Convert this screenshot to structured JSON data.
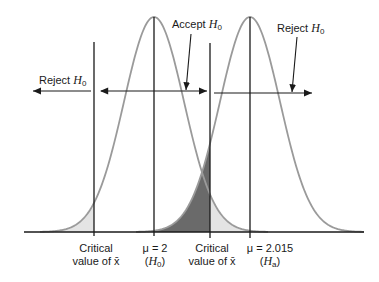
{
  "diagram": {
    "labels": {
      "reject_left": {
        "text": "Reject",
        "symbol": "H",
        "sub": "0"
      },
      "accept": {
        "text": "Accept",
        "symbol": "H",
        "sub": "0"
      },
      "reject_right": {
        "text": "Reject",
        "symbol": "H",
        "sub": "0"
      },
      "critical_left": {
        "line1": "Critical",
        "line2": "value of x̄"
      },
      "mu_null": {
        "line1": "μ = 2",
        "line2_symbol": "H",
        "line2_sub": "0"
      },
      "critical_right": {
        "line1": "Critical",
        "line2": "value of x̄"
      },
      "mu_alt": {
        "line1": "μ = 2.015",
        "line2_symbol": "H",
        "line2_sub": "a"
      }
    },
    "curves": [
      {
        "name": "null-distribution",
        "mean_label": "μ = 2",
        "center_px": 154
      },
      {
        "name": "alternative-distribution",
        "mean_label": "μ = 2.015",
        "center_px": 250
      }
    ],
    "critical_lines_px": [
      94,
      210
    ],
    "colors": {
      "curve": "#9a9a9a",
      "line": "#1a1a1a",
      "light_shade": "#e4e4e4",
      "dark_shade": "#6a6a6a"
    }
  }
}
